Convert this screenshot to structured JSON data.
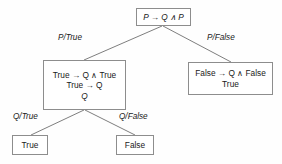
{
  "figure": {
    "type": "proof-tree",
    "title": "",
    "background_color": "#fefefe",
    "line_color": "#8d8d8d",
    "text_color": "#1a1a1a"
  },
  "nodes": {
    "root": {
      "id": "root",
      "lines": [
        "P → Q ∧ P"
      ]
    },
    "left": {
      "id": "left",
      "lines": [
        "True → Q ∧ True",
        "True → Q",
        "Q"
      ]
    },
    "right": {
      "id": "right",
      "lines": [
        "False → Q ∧ False",
        "True"
      ]
    },
    "leaf_true": {
      "id": "leaf-true",
      "lines": [
        "True"
      ]
    },
    "leaf_false": {
      "id": "leaf-false",
      "lines": [
        "False"
      ]
    }
  },
  "edges": [
    {
      "id": "root-left",
      "label": "P/True",
      "from": "root",
      "to": "left"
    },
    {
      "id": "root-right",
      "label": "P/False",
      "from": "root",
      "to": "right"
    },
    {
      "id": "left-leaf-true",
      "label": "Q/True",
      "from": "left",
      "to": "leaf_true"
    },
    {
      "id": "left-leaf-false",
      "label": "Q/False",
      "from": "left",
      "to": "leaf_false"
    }
  ]
}
